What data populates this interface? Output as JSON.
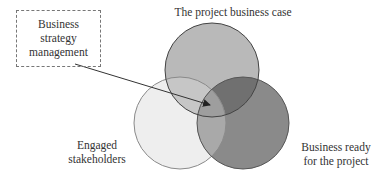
{
  "diagram": {
    "type": "venn",
    "circles": [
      {
        "id": "top",
        "label": "The project business case",
        "cx": 212,
        "cy": 70,
        "r": 47,
        "fill": "#b9b9b9",
        "stroke": "#444444"
      },
      {
        "id": "left",
        "label_lines": [
          "Engaged",
          "stakeholders"
        ],
        "cx": 180,
        "cy": 123,
        "r": 46,
        "fill": "#eeeeee",
        "stroke": "#888888"
      },
      {
        "id": "right",
        "label_lines": [
          "Business ready",
          "for the project"
        ],
        "cx": 243,
        "cy": 123,
        "r": 46,
        "fill": "#8a8a8a",
        "stroke": "#555555"
      }
    ],
    "overlaps": {
      "top_right_fill": "#707070",
      "top_left_fill": "#c6c6c6",
      "left_right_fill": "#a9a9a9",
      "center_fill": "#9e9e9e"
    },
    "callout": {
      "lines": [
        "Business",
        "strategy",
        "management"
      ],
      "border_style": "dashed",
      "arrow": {
        "x1": 75,
        "y1": 64,
        "x2": 212,
        "y2": 106
      }
    }
  },
  "labels": {
    "top": "The project business case",
    "left_line1": "Engaged",
    "left_line2": "stakeholders",
    "right_line1": "Business ready",
    "right_line2": "for the project",
    "callout_line1": "Business",
    "callout_line2": "strategy",
    "callout_line3": "management"
  }
}
